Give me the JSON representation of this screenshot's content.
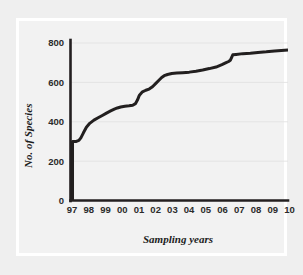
{
  "figure": {
    "background_color": "#efefef",
    "panel_color": "#f2f2f2",
    "frame_color": "#ffffff",
    "line_color": "#221f1f",
    "grid_color": "#e2e2e2"
  },
  "chart_data": {
    "type": "line",
    "title": "",
    "xlabel": "Sampling years",
    "ylabel": "No. of Species",
    "xlim": [
      1997,
      2010
    ],
    "ylim": [
      0,
      840
    ],
    "grid": true,
    "legend": "none",
    "xtick_labels": [
      "97",
      "98",
      "99",
      "00",
      "01",
      "02",
      "03",
      "04",
      "05",
      "06",
      "07",
      "08",
      "09",
      "10"
    ],
    "xtick_values": [
      1997,
      1998,
      1999,
      2000,
      2001,
      2002,
      2003,
      2004,
      2005,
      2006,
      2007,
      2008,
      2009,
      2010
    ],
    "ytick_labels": [
      "0",
      "200",
      "400",
      "600",
      "800"
    ],
    "ytick_values": [
      0,
      200,
      400,
      600,
      800
    ],
    "series": [
      {
        "name": "Cumulative species",
        "x": [
          1997.12,
          1997.12,
          1997.35,
          1997.5,
          1997.62,
          1997.78,
          1997.95,
          1998.15,
          1998.4,
          1998.65,
          1998.9,
          1999.15,
          1999.4,
          1999.62,
          1999.8,
          2000.0,
          2000.25,
          2000.5,
          2000.72,
          2000.88,
          2001.0,
          2001.12,
          2001.3,
          2001.5,
          2001.7,
          2001.9,
          2002.1,
          2002.3,
          2002.45,
          2002.6,
          2002.8,
          2003.05,
          2003.35,
          2003.7,
          2004.1,
          2004.5,
          2004.9,
          2005.3,
          2005.7,
          2006.05,
          2006.3,
          2006.45,
          2006.55,
          2006.7,
          2006.9,
          2007.3,
          2007.75,
          2008.2,
          2008.7,
          2009.2,
          2009.6,
          2010.0
        ],
        "y": [
          0,
          300,
          300,
          305,
          318,
          345,
          372,
          392,
          408,
          420,
          432,
          444,
          455,
          464,
          470,
          475,
          479,
          481,
          484,
          492,
          510,
          535,
          552,
          560,
          566,
          578,
          595,
          612,
          625,
          634,
          640,
          645,
          647,
          649,
          652,
          657,
          663,
          670,
          678,
          690,
          700,
          706,
          712,
          740,
          742,
          746,
          748,
          752,
          755,
          759,
          762,
          764
        ]
      }
    ],
    "annotations": [
      {
        "text": "Initial vertical rise from 0 to ~300 species at first sampling point"
      }
    ]
  }
}
